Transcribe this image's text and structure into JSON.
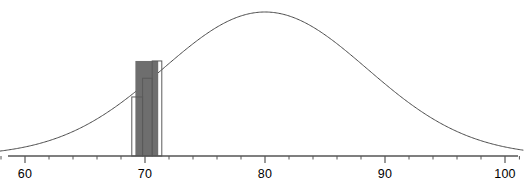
{
  "chart_data": {
    "type": "line",
    "title": "",
    "subtitle": "",
    "xlabel": "",
    "ylabel": "",
    "grid": false,
    "legend_position": "none",
    "xlim": [
      56.5,
      101.5
    ],
    "ylim": [
      0,
      1.05
    ],
    "axis": {
      "major_ticks": [
        60,
        70,
        80,
        90,
        100
      ],
      "major_tick_labels": [
        "60",
        "70",
        "80",
        "90",
        "100"
      ],
      "minor_tick_interval": 2,
      "minor_ticks": [
        58,
        62,
        64,
        66,
        68,
        72,
        74,
        76,
        78,
        82,
        84,
        86,
        88,
        92,
        94,
        96,
        98
      ],
      "axis_color": "#555555",
      "tick_color": "#555555"
    },
    "series": [
      {
        "name": "normal-density-curve",
        "type": "line",
        "mean": 80,
        "std_dev": 8.5,
        "peak_x": 80,
        "peak_y": 1.0,
        "color": "#4a4a4a",
        "line_width": 1,
        "x": [
          56.5,
          58,
          60,
          62,
          64,
          66,
          68,
          70,
          72,
          74,
          76,
          78,
          80,
          82,
          84,
          86,
          88,
          90,
          92,
          94,
          96,
          98,
          100,
          101.5
        ],
        "y": [
          0.02,
          0.03,
          0.05,
          0.08,
          0.12,
          0.18,
          0.26,
          0.36,
          0.49,
          0.63,
          0.78,
          0.93,
          1.0,
          0.93,
          0.78,
          0.63,
          0.49,
          0.36,
          0.26,
          0.18,
          0.12,
          0.08,
          0.05,
          0.03
        ],
        "fill": "none"
      },
      {
        "name": "histogram-bars",
        "type": "bar",
        "bar_edge_color": "#5a5a5a",
        "bar_fill_color": "none",
        "bars": [
          {
            "label": "bar-1",
            "x_left": 68.9,
            "x_right": 69.8,
            "height": 0.41
          },
          {
            "label": "bar-2",
            "x_left": 69.8,
            "x_right": 70.6,
            "height": 0.54
          },
          {
            "label": "bar-3",
            "x_left": 70.6,
            "x_right": 71.4,
            "height": 0.66
          }
        ]
      },
      {
        "name": "shaded-region",
        "type": "area",
        "fill_color": "#6e6e6e",
        "x_left": 69.2,
        "x_right": 71.1,
        "description": "dark gray shaded rectangular region under the stepped bars"
      }
    ]
  },
  "axis_labels": [
    {
      "value": 60,
      "text": "60"
    },
    {
      "value": 70,
      "text": "70"
    },
    {
      "value": 80,
      "text": "80"
    },
    {
      "value": 90,
      "text": "90"
    },
    {
      "value": 100,
      "text": "100"
    }
  ],
  "colors": {
    "background": "#ffffff",
    "curve": "#4a4a4a",
    "axis": "#555555",
    "bar_outline": "#5a5a5a",
    "shade_fill": "#6e6e6e",
    "text": "#000000"
  }
}
